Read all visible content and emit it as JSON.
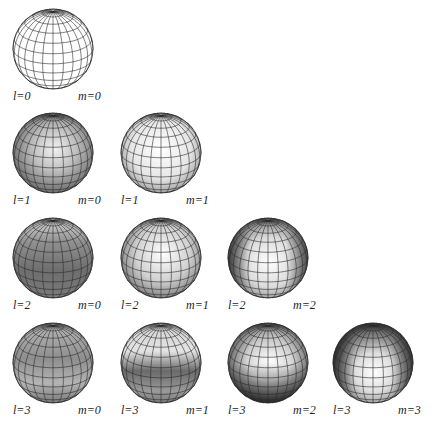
{
  "figure": {
    "type": "spherical-harmonics-grid",
    "rows": [
      {
        "l": 0,
        "cells": [
          {
            "l_label": "l=0",
            "m_label": "m=0",
            "shading": "none"
          }
        ]
      },
      {
        "l": 1,
        "cells": [
          {
            "l_label": "l=1",
            "m_label": "m=0",
            "shading": "l1m0"
          },
          {
            "l_label": "l=1",
            "m_label": "m=1",
            "shading": "l1m1"
          }
        ]
      },
      {
        "l": 2,
        "cells": [
          {
            "l_label": "l=2",
            "m_label": "m=0",
            "shading": "l2m0"
          },
          {
            "l_label": "l=2",
            "m_label": "m=1",
            "shading": "l2m1"
          },
          {
            "l_label": "l=2",
            "m_label": "m=2",
            "shading": "l2m2"
          }
        ]
      },
      {
        "l": 3,
        "cells": [
          {
            "l_label": "l=3",
            "m_label": "m=0",
            "shading": "l3m0"
          },
          {
            "l_label": "l=3",
            "m_label": "m=1",
            "shading": "l3m1"
          },
          {
            "l_label": "l=3",
            "m_label": "m=2",
            "shading": "l3m2"
          },
          {
            "l_label": "l=3",
            "m_label": "m=3",
            "shading": "l3m3"
          }
        ]
      }
    ],
    "colors": {
      "grid_line": "#2a2a2a",
      "light": "#ffffff",
      "dark": "#4a4a4a",
      "label": "#222222"
    }
  }
}
